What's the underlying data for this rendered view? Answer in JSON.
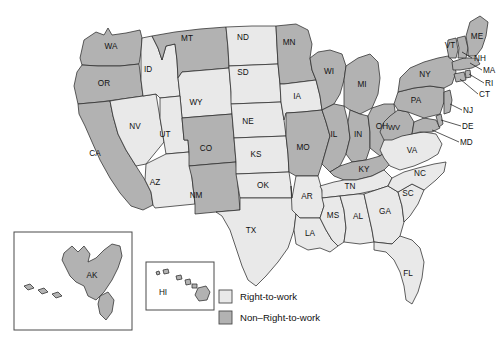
{
  "figure": {
    "type": "choropleth-map",
    "region": "United States",
    "background_color": "#ffffff"
  },
  "colors": {
    "right_to_work_fill": "#e9e9e9",
    "non_right_to_work_fill": "#b2b2b2",
    "state_border": "#2b2b2b",
    "inset_border": "#4a4a4a",
    "label_text": "#111111"
  },
  "legend": {
    "items": [
      {
        "label": "Right-to-work",
        "color": "#e9e9e9",
        "key": "rtw"
      },
      {
        "label": "Non–Right-to-work",
        "color": "#b2b2b2",
        "key": "nrtw"
      }
    ]
  },
  "insets": [
    {
      "name": "alaska-inset",
      "label": "AK",
      "status": "nrtw"
    },
    {
      "name": "hawaii-inset",
      "label": "HI",
      "status": "nrtw"
    }
  ],
  "states": [
    {
      "code": "WA",
      "status": "nrtw"
    },
    {
      "code": "OR",
      "status": "nrtw"
    },
    {
      "code": "CA",
      "status": "nrtw"
    },
    {
      "code": "NV",
      "status": "rtw"
    },
    {
      "code": "ID",
      "status": "rtw"
    },
    {
      "code": "MT",
      "status": "nrtw"
    },
    {
      "code": "WY",
      "status": "rtw"
    },
    {
      "code": "UT",
      "status": "rtw"
    },
    {
      "code": "AZ",
      "status": "rtw"
    },
    {
      "code": "CO",
      "status": "nrtw"
    },
    {
      "code": "NM",
      "status": "nrtw"
    },
    {
      "code": "ND",
      "status": "rtw"
    },
    {
      "code": "SD",
      "status": "rtw"
    },
    {
      "code": "NE",
      "status": "rtw"
    },
    {
      "code": "KS",
      "status": "rtw"
    },
    {
      "code": "OK",
      "status": "rtw"
    },
    {
      "code": "TX",
      "status": "rtw"
    },
    {
      "code": "MN",
      "status": "nrtw"
    },
    {
      "code": "IA",
      "status": "rtw"
    },
    {
      "code": "MO",
      "status": "nrtw"
    },
    {
      "code": "AR",
      "status": "rtw"
    },
    {
      "code": "LA",
      "status": "rtw"
    },
    {
      "code": "WI",
      "status": "nrtw"
    },
    {
      "code": "IL",
      "status": "nrtw"
    },
    {
      "code": "MI",
      "status": "nrtw"
    },
    {
      "code": "IN",
      "status": "nrtw"
    },
    {
      "code": "OH",
      "status": "nrtw"
    },
    {
      "code": "KY",
      "status": "nrtw"
    },
    {
      "code": "TN",
      "status": "rtw"
    },
    {
      "code": "MS",
      "status": "rtw"
    },
    {
      "code": "AL",
      "status": "rtw"
    },
    {
      "code": "GA",
      "status": "rtw"
    },
    {
      "code": "FL",
      "status": "rtw"
    },
    {
      "code": "SC",
      "status": "rtw"
    },
    {
      "code": "NC",
      "status": "rtw"
    },
    {
      "code": "VA",
      "status": "rtw"
    },
    {
      "code": "WV",
      "status": "nrtw"
    },
    {
      "code": "MD",
      "status": "nrtw"
    },
    {
      "code": "DE",
      "status": "nrtw"
    },
    {
      "code": "PA",
      "status": "nrtw"
    },
    {
      "code": "NJ",
      "status": "nrtw"
    },
    {
      "code": "NY",
      "status": "nrtw"
    },
    {
      "code": "CT",
      "status": "nrtw"
    },
    {
      "code": "RI",
      "status": "nrtw"
    },
    {
      "code": "MA",
      "status": "nrtw"
    },
    {
      "code": "VT",
      "status": "nrtw"
    },
    {
      "code": "NH",
      "status": "nrtw"
    },
    {
      "code": "ME",
      "status": "nrtw"
    },
    {
      "code": "AK",
      "status": "nrtw"
    },
    {
      "code": "HI",
      "status": "nrtw"
    }
  ],
  "labels": {
    "WA": "WA",
    "OR": "OR",
    "CA": "CA",
    "NV": "NV",
    "ID": "ID",
    "MT": "MT",
    "WY": "WY",
    "UT": "UT",
    "AZ": "AZ",
    "CO": "CO",
    "NM": "NM",
    "ND": "ND",
    "SD": "SD",
    "NE": "NE",
    "KS": "KS",
    "OK": "OK",
    "TX": "TX",
    "MN": "MN",
    "IA": "IA",
    "MO": "MO",
    "AR": "AR",
    "LA": "LA",
    "WI": "WI",
    "IL": "IL",
    "MI": "MI",
    "IN": "IN",
    "OH": "OH",
    "KY": "KY",
    "TN": "TN",
    "MS": "MS",
    "AL": "AL",
    "GA": "GA",
    "FL": "FL",
    "SC": "SC",
    "NC": "NC",
    "VA": "VA",
    "WV": "WV",
    "MD": "MD",
    "DE": "DE",
    "PA": "PA",
    "NJ": "NJ",
    "NY": "NY",
    "CT": "CT",
    "RI": "RI",
    "MA": "MA",
    "VT": "VT",
    "NH": "NH",
    "ME": "ME",
    "AK": "AK",
    "HI": "HI"
  }
}
